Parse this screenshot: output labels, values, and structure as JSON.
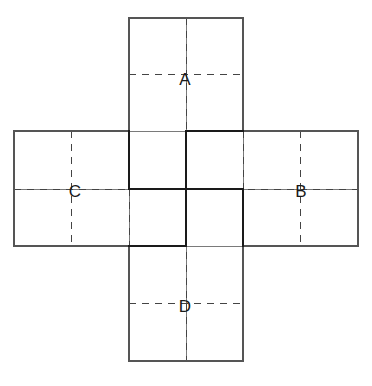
{
  "figure": {
    "type": "diagram",
    "background_color": "#ffffff",
    "canvas": {
      "width": 372,
      "height": 386
    }
  },
  "style": {
    "outline_color": "#555555",
    "outline_width": 1.1,
    "grid_color": "#6b6b6b",
    "grid_width": 0.9,
    "dash_color": "#444444",
    "dash_width": 1.0,
    "dash_pattern": "7 6",
    "bold_color": "#1a1a1a",
    "bold_width": 2.6,
    "label_color": "#1a1a1a",
    "label_size": 17
  },
  "geometry": {
    "x_ticks": [
      14,
      71.5,
      129,
      186,
      243,
      300.5,
      358
    ],
    "y_ticks": [
      18,
      74.5,
      131,
      189,
      246,
      303.5,
      361
    ],
    "cell_width": 115,
    "cell_height": 115,
    "vertical_strip": {
      "x0": 129,
      "x1": 243,
      "y0": 18,
      "y1": 361
    },
    "horizontal_strip": {
      "x0": 14,
      "x1": 358,
      "y0": 131,
      "y1": 246
    }
  },
  "outline_paths": [
    "M 129 18 L 243 18 L 243 131 L 358 131 L 358 246 L 243 246 L 243 361 L 129 361 L 129 246 L 14 246 L 14 131 L 129 131 Z"
  ],
  "grid_lines": [
    {
      "name": "inner-vertical-left",
      "x1": 129,
      "y1": 131,
      "x2": 129,
      "y2": 246
    },
    {
      "name": "inner-vertical-mid",
      "x1": 186,
      "y1": 18,
      "x2": 186,
      "y2": 361
    },
    {
      "name": "inner-vertical-right",
      "x1": 243,
      "y1": 131,
      "x2": 243,
      "y2": 246
    },
    {
      "name": "inner-horizontal-top",
      "x1": 129,
      "y1": 131,
      "x2": 243,
      "y2": 131
    },
    {
      "name": "inner-horizontal-mid",
      "x1": 14,
      "y1": 189,
      "x2": 358,
      "y2": 189
    },
    {
      "name": "inner-horizontal-bottom",
      "x1": 129,
      "y1": 246,
      "x2": 243,
      "y2": 246
    }
  ],
  "dashed_lines": [
    {
      "name": "dash-v-col1",
      "x1": 71.5,
      "y1": 131,
      "x2": 71.5,
      "y2": 246
    },
    {
      "name": "dash-v-col3-top",
      "x1": 186,
      "y1": 18,
      "x2": 186,
      "y2": 361
    },
    {
      "name": "dash-v-col5",
      "x1": 300.5,
      "y1": 131,
      "x2": 300.5,
      "y2": 246
    },
    {
      "name": "dash-h-row1",
      "x1": 129,
      "y1": 74.5,
      "x2": 243,
      "y2": 74.5
    },
    {
      "name": "dash-h-row3",
      "x1": 14,
      "y1": 189,
      "x2": 358,
      "y2": 189
    },
    {
      "name": "dash-h-row5",
      "x1": 129,
      "y1": 303.5,
      "x2": 243,
      "y2": 303.5
    },
    {
      "name": "dash-v-centre-left",
      "x1": 129,
      "y1": 189,
      "x2": 129,
      "y2": 246
    },
    {
      "name": "dash-v-centre-right",
      "x1": 243,
      "y1": 131,
      "x2": 243,
      "y2": 189
    }
  ],
  "bold_path": {
    "name": "highlighted-fold-path",
    "description": "Heavy polyline outlining the central fold region",
    "segments": [
      {
        "name": "bold-top-horizontal",
        "x1": 186,
        "y1": 131,
        "x2": 243,
        "y2": 131
      },
      {
        "name": "bold-left-vertical",
        "x1": 129,
        "y1": 131,
        "x2": 129,
        "y2": 189
      },
      {
        "name": "bold-mid-horizontal",
        "x1": 129,
        "y1": 189,
        "x2": 243,
        "y2": 189
      },
      {
        "name": "bold-right-vertical",
        "x1": 243,
        "y1": 189,
        "x2": 243,
        "y2": 246
      },
      {
        "name": "bold-bottom-horizontal",
        "x1": 129,
        "y1": 246,
        "x2": 186,
        "y2": 246
      },
      {
        "name": "bold-centre-vertical",
        "x1": 186,
        "y1": 131,
        "x2": 186,
        "y2": 246
      }
    ]
  },
  "labels": [
    {
      "id": "label-a",
      "text": "A",
      "x": 185,
      "y": 79
    },
    {
      "id": "label-b",
      "text": "B",
      "x": 301,
      "y": 191
    },
    {
      "id": "label-c",
      "text": "C",
      "x": 75,
      "y": 191
    },
    {
      "id": "label-d",
      "text": "D",
      "x": 185,
      "y": 306
    }
  ]
}
